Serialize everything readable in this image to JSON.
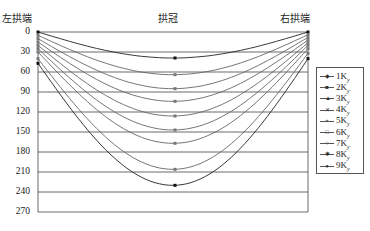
{
  "chart_data": {
    "type": "line",
    "title": "",
    "xlabel": "",
    "ylabel": "",
    "x": [
      "左拱端",
      "拱冠",
      "右拱端"
    ],
    "x_labels": {
      "left": "左拱端",
      "center": "拱冠",
      "right": "右拱端"
    },
    "yticks": [
      "0",
      "30",
      "60",
      "90",
      "120",
      "150",
      "180",
      "210",
      "240",
      "270"
    ],
    "ylim": [
      0,
      270
    ],
    "y_inverted": true,
    "grid": true,
    "legend_position": "right",
    "series": [
      {
        "name": "1K_y",
        "label": "1K",
        "sub": "y",
        "values": [
          0,
          39,
          0
        ]
      },
      {
        "name": "2K_y",
        "label": "2K",
        "sub": "y",
        "values": [
          5,
          64,
          4
        ]
      },
      {
        "name": "3K_y",
        "label": "3K",
        "sub": "y",
        "values": [
          10,
          85,
          8
        ]
      },
      {
        "name": "4K_y",
        "label": "4K",
        "sub": "y",
        "values": [
          15,
          104,
          12
        ]
      },
      {
        "name": "5K_y",
        "label": "5K",
        "sub": "y",
        "values": [
          20,
          126,
          16
        ]
      },
      {
        "name": "6K_y",
        "label": "6K",
        "sub": "y",
        "values": [
          25,
          147,
          20
        ]
      },
      {
        "name": "7K_y",
        "label": "7K",
        "sub": "y",
        "values": [
          30,
          167,
          25
        ]
      },
      {
        "name": "8K_y",
        "label": "8K",
        "sub": "y",
        "values": [
          40,
          206,
          32
        ]
      },
      {
        "name": "9K_y",
        "label": "9K",
        "sub": "y",
        "values": [
          47,
          230,
          40
        ]
      }
    ]
  }
}
